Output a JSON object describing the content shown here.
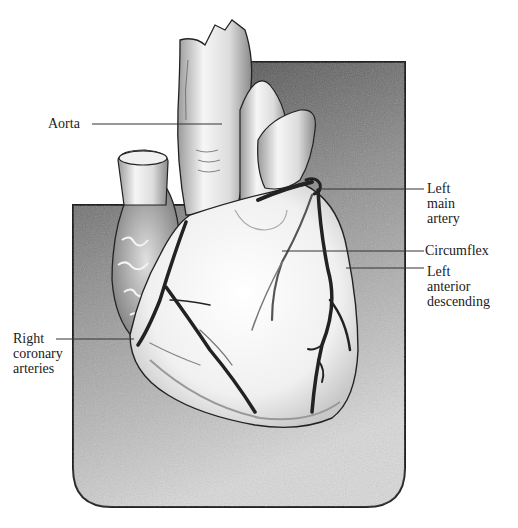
{
  "figure": {
    "colors": {
      "background": "#ffffff",
      "panel_dark": "#3a3a3a",
      "panel_light": "#d8d8d8",
      "heart_fill": "#f4f4f4",
      "artery": "#222222",
      "leader_line": "#333333"
    }
  },
  "labels": {
    "aorta": "Aorta",
    "left_main": [
      "Left",
      "main",
      "artery"
    ],
    "circumflex": "Circumflex",
    "lad": [
      "Left",
      "anterior",
      "descending"
    ],
    "right_coronary": [
      "Right",
      "coronary",
      "arteries"
    ]
  }
}
